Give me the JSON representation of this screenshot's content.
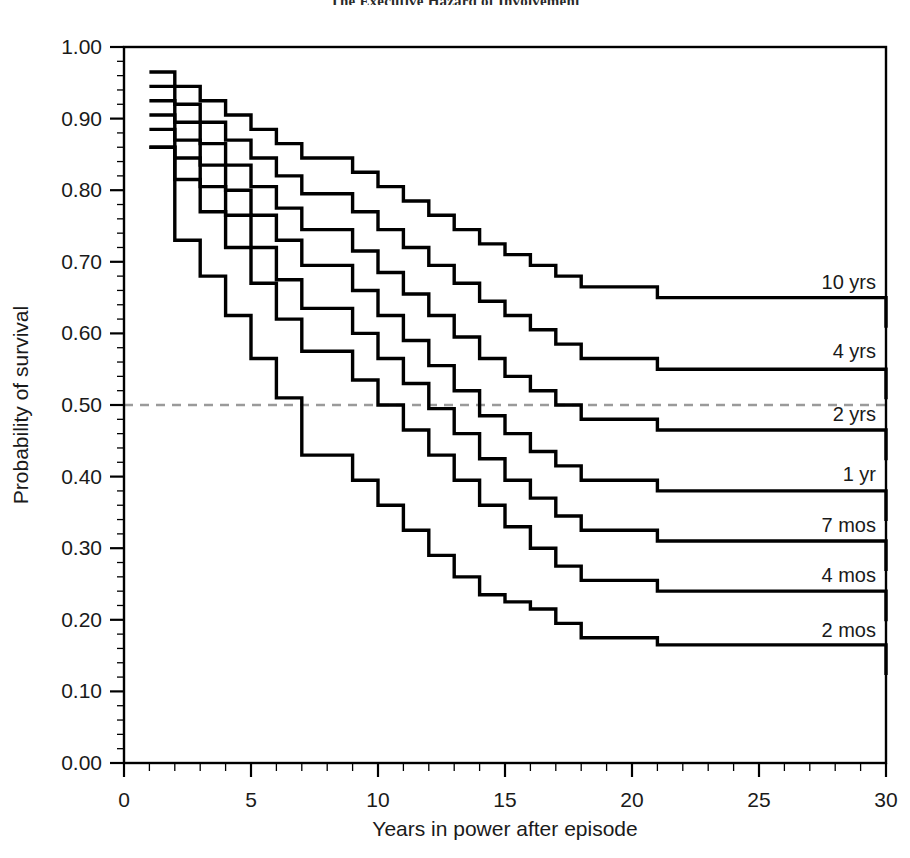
{
  "title": {
    "text": "The Executive Hazard of Involvement",
    "suffix": "y?",
    "clipped": true
  },
  "chart_data": {
    "type": "line",
    "subtype": "kaplan-meier-step",
    "title": "The Executive Hazard of Involvement",
    "xlabel": "Years in power after episode",
    "ylabel": "Probability of survival",
    "xlim": [
      0,
      30
    ],
    "ylim": [
      0.0,
      1.0
    ],
    "xticks": [
      0,
      5,
      10,
      15,
      20,
      25,
      30
    ],
    "xtick_labels": [
      "0",
      "5",
      "10",
      "15",
      "20",
      "25",
      "30"
    ],
    "x_minor_tick_interval": 1,
    "yticks": [
      0.0,
      0.1,
      0.2,
      0.3,
      0.4,
      0.5,
      0.6,
      0.7,
      0.8,
      0.9,
      1.0
    ],
    "ytick_labels": [
      "0.00",
      "0.10",
      "0.20",
      "0.30",
      "0.40",
      "0.50",
      "0.60",
      "0.70",
      "0.80",
      "0.90",
      "1.00"
    ],
    "y_minor_tick_interval": 0.02,
    "grid": false,
    "legend_position": "inline-right-of-curve",
    "reference_line": {
      "axis": "y",
      "value": 0.5,
      "style": "dashed",
      "color": "#9a9a9a"
    },
    "line_color": "#000000",
    "series": [
      {
        "name": "10 yrs",
        "label": "10 yrs",
        "label_x": 30,
        "label_y": 0.672,
        "final_value": 0.65,
        "points": [
          [
            1,
            0.965
          ],
          [
            2,
            0.945
          ],
          [
            3,
            0.925
          ],
          [
            4,
            0.905
          ],
          [
            5,
            0.885
          ],
          [
            6,
            0.865
          ],
          [
            7,
            0.845
          ],
          [
            9,
            0.825
          ],
          [
            10,
            0.805
          ],
          [
            11,
            0.785
          ],
          [
            12,
            0.765
          ],
          [
            13,
            0.745
          ],
          [
            14,
            0.725
          ],
          [
            15,
            0.71
          ],
          [
            16,
            0.695
          ],
          [
            17,
            0.68
          ],
          [
            18,
            0.665
          ],
          [
            21,
            0.65
          ],
          [
            30,
            0.65
          ]
        ]
      },
      {
        "name": "4 yrs",
        "label": "4 yrs",
        "label_x": 30,
        "label_y": 0.575,
        "final_value": 0.55,
        "points": [
          [
            1,
            0.945
          ],
          [
            2,
            0.92
          ],
          [
            3,
            0.895
          ],
          [
            4,
            0.87
          ],
          [
            5,
            0.845
          ],
          [
            6,
            0.82
          ],
          [
            7,
            0.795
          ],
          [
            9,
            0.77
          ],
          [
            10,
            0.745
          ],
          [
            11,
            0.72
          ],
          [
            12,
            0.695
          ],
          [
            13,
            0.67
          ],
          [
            14,
            0.645
          ],
          [
            15,
            0.625
          ],
          [
            16,
            0.605
          ],
          [
            17,
            0.585
          ],
          [
            18,
            0.565
          ],
          [
            21,
            0.55
          ],
          [
            30,
            0.55
          ]
        ]
      },
      {
        "name": "2 yrs",
        "label": "2 yrs",
        "label_x": 30,
        "label_y": 0.487,
        "final_value": 0.465,
        "points": [
          [
            1,
            0.925
          ],
          [
            2,
            0.895
          ],
          [
            3,
            0.865
          ],
          [
            4,
            0.835
          ],
          [
            5,
            0.805
          ],
          [
            6,
            0.775
          ],
          [
            7,
            0.745
          ],
          [
            9,
            0.715
          ],
          [
            10,
            0.685
          ],
          [
            11,
            0.655
          ],
          [
            12,
            0.625
          ],
          [
            13,
            0.595
          ],
          [
            14,
            0.565
          ],
          [
            15,
            0.54
          ],
          [
            16,
            0.52
          ],
          [
            17,
            0.5
          ],
          [
            18,
            0.48
          ],
          [
            21,
            0.465
          ],
          [
            30,
            0.465
          ]
        ]
      },
      {
        "name": "1 yr",
        "label": "1 yr",
        "label_x": 30,
        "label_y": 0.403,
        "final_value": 0.38,
        "points": [
          [
            1,
            0.905
          ],
          [
            2,
            0.87
          ],
          [
            3,
            0.835
          ],
          [
            4,
            0.8
          ],
          [
            5,
            0.765
          ],
          [
            6,
            0.73
          ],
          [
            7,
            0.695
          ],
          [
            9,
            0.66
          ],
          [
            10,
            0.625
          ],
          [
            11,
            0.59
          ],
          [
            12,
            0.555
          ],
          [
            13,
            0.52
          ],
          [
            14,
            0.485
          ],
          [
            15,
            0.46
          ],
          [
            16,
            0.435
          ],
          [
            17,
            0.415
          ],
          [
            18,
            0.395
          ],
          [
            21,
            0.38
          ],
          [
            30,
            0.38
          ]
        ]
      },
      {
        "name": "7 mos",
        "label": "7 mos",
        "label_x": 30,
        "label_y": 0.333,
        "final_value": 0.31,
        "points": [
          [
            1,
            0.885
          ],
          [
            2,
            0.845
          ],
          [
            3,
            0.805
          ],
          [
            4,
            0.765
          ],
          [
            5,
            0.72
          ],
          [
            6,
            0.675
          ],
          [
            7,
            0.635
          ],
          [
            9,
            0.6
          ],
          [
            10,
            0.565
          ],
          [
            11,
            0.53
          ],
          [
            12,
            0.495
          ],
          [
            13,
            0.46
          ],
          [
            14,
            0.425
          ],
          [
            15,
            0.395
          ],
          [
            16,
            0.37
          ],
          [
            17,
            0.345
          ],
          [
            18,
            0.325
          ],
          [
            21,
            0.31
          ],
          [
            30,
            0.31
          ]
        ]
      },
      {
        "name": "4 mos",
        "label": "4 mos",
        "label_x": 30,
        "label_y": 0.262,
        "final_value": 0.24,
        "points": [
          [
            1,
            0.86
          ],
          [
            2,
            0.815
          ],
          [
            3,
            0.77
          ],
          [
            4,
            0.72
          ],
          [
            5,
            0.67
          ],
          [
            6,
            0.62
          ],
          [
            7,
            0.575
          ],
          [
            9,
            0.535
          ],
          [
            10,
            0.5
          ],
          [
            11,
            0.465
          ],
          [
            12,
            0.43
          ],
          [
            13,
            0.395
          ],
          [
            14,
            0.36
          ],
          [
            15,
            0.33
          ],
          [
            16,
            0.3
          ],
          [
            17,
            0.275
          ],
          [
            18,
            0.255
          ],
          [
            21,
            0.24
          ],
          [
            30,
            0.24
          ]
        ]
      },
      {
        "name": "2 mos",
        "label": "2 mos",
        "label_x": 30,
        "label_y": 0.186,
        "final_value": 0.165,
        "points": [
          [
            1,
            0.86
          ],
          [
            2,
            0.73
          ],
          [
            3,
            0.68
          ],
          [
            4,
            0.625
          ],
          [
            5,
            0.565
          ],
          [
            6,
            0.51
          ],
          [
            7,
            0.43
          ],
          [
            9,
            0.395
          ],
          [
            10,
            0.36
          ],
          [
            11,
            0.325
          ],
          [
            12,
            0.29
          ],
          [
            13,
            0.26
          ],
          [
            14,
            0.235
          ],
          [
            15,
            0.225
          ],
          [
            16,
            0.215
          ],
          [
            17,
            0.195
          ],
          [
            18,
            0.175
          ],
          [
            21,
            0.165
          ],
          [
            30,
            0.165
          ]
        ]
      }
    ]
  }
}
